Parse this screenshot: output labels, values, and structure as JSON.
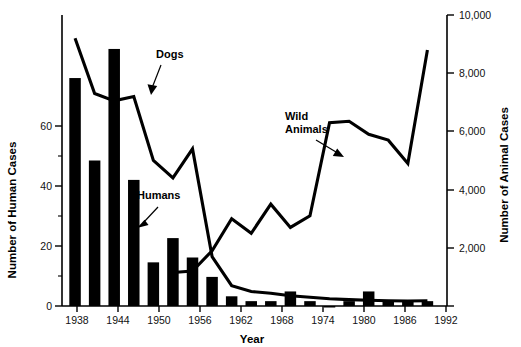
{
  "chart_data": {
    "type": "bar",
    "title": "",
    "xlabel": "Year",
    "ylabel": "Number of Human Cases",
    "y2label": "Number of Animal Cases",
    "grid": false,
    "legend_position": "inline-annotations",
    "xlim": [
      1936,
      1995
    ],
    "ylim": [
      0,
      60
    ],
    "y2lim": [
      0,
      10000
    ],
    "xticks": [
      1938,
      1944,
      1950,
      1956,
      1962,
      1968,
      1974,
      1980,
      1986,
      1992
    ],
    "xticklabels": [
      "1938",
      "1944",
      "1950",
      "1956",
      "1962",
      "1968",
      "1974",
      "1980",
      "1986",
      "1992"
    ],
    "yticks": [
      0,
      20,
      40,
      60
    ],
    "yticklabels": [
      "0",
      "20",
      "40",
      "60"
    ],
    "yticks_minor": [
      10,
      30,
      50
    ],
    "y2ticks": [
      2000,
      4000,
      6000,
      8000,
      10000
    ],
    "y2ticklabels": [
      "2,000",
      "4,000",
      "6,000",
      "8,000",
      "10,000"
    ],
    "annotations": [
      {
        "text": "Dogs",
        "series": "Dogs"
      },
      {
        "text": "Humans",
        "series": "Humans"
      },
      {
        "text": "Wild\nAnimals",
        "series": "Wild Animals",
        "line1": "Wild",
        "line2": "Animals"
      }
    ],
    "series": [
      {
        "name": "Humans",
        "type": "bar",
        "axis": "left",
        "units": "cases",
        "x": [
          1938,
          1941,
          1944,
          1947,
          1950,
          1953,
          1956,
          1959,
          1962,
          1965,
          1968,
          1971,
          1974,
          1977,
          1980,
          1983,
          1986,
          1989,
          1992
        ],
        "values": [
          47,
          30,
          53,
          26,
          9,
          14,
          10,
          6,
          2,
          1,
          1,
          3,
          1,
          0,
          1,
          3,
          1,
          1,
          1
        ]
      },
      {
        "name": "Dogs",
        "type": "line",
        "axis": "right",
        "units": "cases",
        "x": [
          1938,
          1941,
          1944,
          1947,
          1950,
          1953,
          1956,
          1959,
          1962,
          1965,
          1968,
          1971,
          1974,
          1977,
          1980,
          1983,
          1986,
          1989,
          1992
        ],
        "values": [
          9200,
          7300,
          7050,
          7200,
          5000,
          4400,
          5400,
          1700,
          700,
          500,
          440,
          350,
          300,
          250,
          220,
          200,
          180,
          170,
          180
        ]
      },
      {
        "name": "Wild Animals",
        "type": "line",
        "axis": "right",
        "units": "cases",
        "x": [
          1938,
          1941,
          1944,
          1947,
          1950,
          1953,
          1956,
          1959,
          1962,
          1965,
          1968,
          1971,
          1974,
          1977,
          1980,
          1983,
          1986,
          1989,
          1992
        ],
        "values": [
          null,
          null,
          null,
          null,
          null,
          1150,
          1200,
          1900,
          3000,
          2500,
          3500,
          2700,
          3100,
          6300,
          6350,
          5900,
          5700,
          4900,
          8800
        ]
      }
    ]
  }
}
